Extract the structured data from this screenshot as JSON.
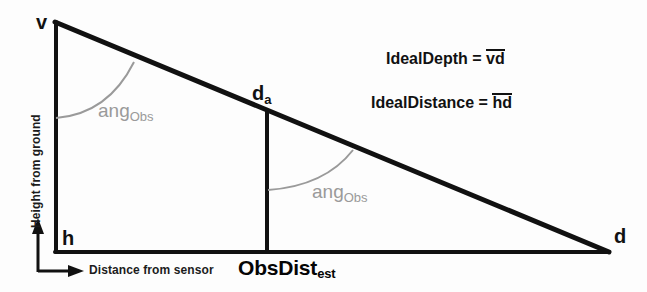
{
  "figure": {
    "background_color": "#fdfdfd",
    "line_color": "#111111",
    "arc_color": "#9a9a9a"
  },
  "vertices": {
    "apex": "v",
    "origin": "h",
    "far": "d",
    "mid_base": "d",
    "mid_base_sub": "a"
  },
  "angles": [
    {
      "label": "ang",
      "sub": "Obs"
    },
    {
      "label": "ang",
      "sub": "Obs"
    }
  ],
  "formulas": [
    {
      "name": "IdealDepth",
      "equals": "=",
      "segment": "vd"
    },
    {
      "name": "IdealDistance",
      "equals": "=",
      "segment": "hd"
    }
  ],
  "axes": {
    "vertical_label": "Height from ground",
    "horizontal_label": "Distance from sensor"
  },
  "measurements": {
    "obs_dist": "ObsDist",
    "obs_dist_sub": "est"
  }
}
